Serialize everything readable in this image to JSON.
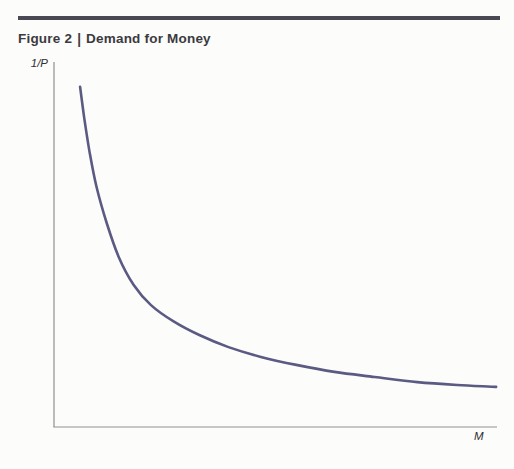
{
  "header": {
    "figure_label": "Figure 2",
    "separator": "|",
    "figure_title": "Demand for Money"
  },
  "colors": {
    "top_rule": "#4a4953",
    "curve": "#5a5a82",
    "axis": "#8f8f8f",
    "title_text": "#3b3a3e",
    "label_text": "#2f2e32",
    "background": "#fcfcfb"
  },
  "chart_data": {
    "type": "line",
    "xlabel": "M",
    "ylabel": "1/P",
    "x_range": [
      0,
      100
    ],
    "y_range": [
      0,
      100
    ],
    "grid": false,
    "axis_ticks": "none",
    "legend": "none",
    "series": [
      {
        "name": "money-demand-curve",
        "shape": "rectangular-hyperbola",
        "points": [
          [
            5.9,
            93.2
          ],
          [
            6.8,
            84.9
          ],
          [
            8.0,
            75.6
          ],
          [
            9.6,
            65.8
          ],
          [
            11.9,
            55.9
          ],
          [
            14.6,
            46.6
          ],
          [
            18.0,
            38.9
          ],
          [
            21.9,
            33.4
          ],
          [
            26.9,
            29.0
          ],
          [
            32.8,
            25.2
          ],
          [
            39.4,
            21.9
          ],
          [
            46.7,
            19.2
          ],
          [
            54.7,
            17.0
          ],
          [
            63.3,
            15.1
          ],
          [
            72.4,
            13.7
          ],
          [
            82.0,
            12.3
          ],
          [
            91.1,
            11.5
          ],
          [
            99.8,
            11.0
          ]
        ]
      }
    ]
  }
}
